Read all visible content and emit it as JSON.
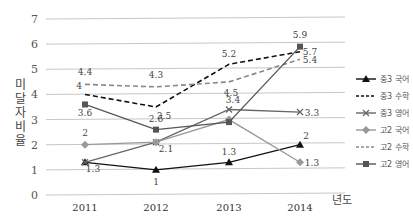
{
  "chart_data": {
    "type": "line",
    "title": "",
    "xlabel": "년도",
    "ylabel": "미달자 비율",
    "x": [
      "2011",
      "2012",
      "2013",
      "2014"
    ],
    "ylim": [
      0,
      7
    ],
    "yticks": [
      0,
      1,
      2,
      3,
      4,
      5,
      6,
      7
    ],
    "grid": true,
    "legend_position": "right",
    "series": [
      {
        "name": "중3 국어",
        "values": [
          1.3,
          1,
          1.3,
          2
        ],
        "labels": [
          "",
          "1",
          "1.3",
          "2"
        ],
        "color": "#111111",
        "dash": "solid",
        "marker": "triangle"
      },
      {
        "name": "중3 수학",
        "values": [
          4,
          3.5,
          5.2,
          5.7
        ],
        "labels": [
          "4",
          "3.5",
          "5.2",
          "5.7"
        ],
        "color": "#111111",
        "dash": "dashed",
        "marker": "none"
      },
      {
        "name": "중3 영어",
        "values": [
          1.3,
          2.1,
          3.4,
          3.3
        ],
        "labels": [
          "1.3",
          "2.1",
          "3.4",
          "3.3"
        ],
        "color": "#666666",
        "dash": "solid",
        "marker": "x"
      },
      {
        "name": "고2 국어",
        "values": [
          2,
          2.1,
          3.0,
          1.3
        ],
        "labels": [
          "2",
          "",
          "",
          "1.3"
        ],
        "color": "#999999",
        "dash": "solid",
        "marker": "diamond"
      },
      {
        "name": "고2 수학",
        "values": [
          4.4,
          4.3,
          4.5,
          5.4
        ],
        "labels": [
          "4.4",
          "4.3",
          "4.5",
          "5.4"
        ],
        "color": "#888888",
        "dash": "dashed",
        "marker": "none"
      },
      {
        "name": "고2 영어",
        "values": [
          3.6,
          2.6,
          2.9,
          5.9
        ],
        "labels": [
          "3.6",
          "2.6",
          "",
          "5.9"
        ],
        "color": "#555555",
        "dash": "solid",
        "marker": "square"
      }
    ]
  },
  "axis": {
    "ylabel": "미달자비율",
    "xunit": "년도"
  },
  "legend": [
    {
      "label": "중3 국어"
    },
    {
      "label": "중3 수학"
    },
    {
      "label": "중3 영어"
    },
    {
      "label": "고2 국어"
    },
    {
      "label": "고2 수학"
    },
    {
      "label": "고2 영어"
    }
  ]
}
